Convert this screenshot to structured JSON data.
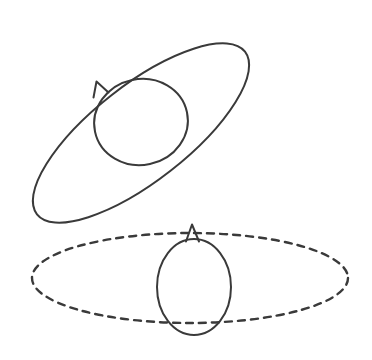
{
  "figure": {
    "background_color": "#ffffff",
    "stroke_color": "#3a3a3a",
    "width": 372,
    "height": 360
  },
  "chart_data": {
    "type": "diagram",
    "xlabel": "",
    "ylabel": "",
    "grid": false,
    "legend": "none",
    "xlim": [
      0,
      372
    ],
    "ylim": [
      0,
      360
    ],
    "shapes": [
      {
        "name": "tilted-orbit-ellipse",
        "kind": "ellipse",
        "cx": 141,
        "cy": 133,
        "rx": 132,
        "ry": 48,
        "rotation_deg": -38,
        "line_style": "solid",
        "stroke_width": 2.0
      },
      {
        "name": "tilted-body-circle",
        "kind": "ellipse",
        "cx": 141,
        "cy": 122,
        "rx": 47,
        "ry": 43,
        "rotation_deg": -12,
        "line_style": "solid",
        "stroke_width": 2.0
      },
      {
        "name": "tilted-axis-marker",
        "kind": "triangle-marker",
        "tip_x": 96,
        "tip_y": 82,
        "base_left_x": 93,
        "base_left_y": 96,
        "base_right_x": 108,
        "base_right_y": 92,
        "line_style": "solid",
        "stroke_width": 2.0
      },
      {
        "name": "upright-orbit-ellipse",
        "kind": "ellipse",
        "cx": 190,
        "cy": 278,
        "rx": 158,
        "ry": 45,
        "rotation_deg": 0,
        "line_style": "dashed",
        "dash_on": 7,
        "dash_off": 6,
        "stroke_width": 2.4
      },
      {
        "name": "upright-body-oval",
        "kind": "ellipse",
        "cx": 194,
        "cy": 287,
        "rx": 37,
        "ry": 48,
        "rotation_deg": 0,
        "line_style": "solid",
        "stroke_width": 2.0
      },
      {
        "name": "upright-axis-marker",
        "kind": "triangle-marker",
        "tip_x": 192,
        "tip_y": 225,
        "base_left_x": 186,
        "base_left_y": 241,
        "base_right_x": 199,
        "base_right_y": 241,
        "line_style": "solid",
        "stroke_width": 2.0
      }
    ],
    "annotations": []
  }
}
